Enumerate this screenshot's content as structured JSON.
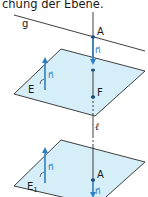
{
  "caption": "chung der Ebene.",
  "colors": {
    "plane_fill": "#d6eef8",
    "plane_stroke": "#2a2a2a",
    "vector_blue": "#2f7fc4",
    "line": "#2a2a2a",
    "point_fill": "#1d4f7a"
  },
  "labels": {
    "line_g": "g",
    "point_A_top": "A",
    "normal_top": "n⃗",
    "plane_E": "E",
    "normal_E": "n⃗",
    "point_F": "F",
    "line_l": "ℓ",
    "plane_E1_main": "E",
    "plane_E1_sub": "1",
    "normal_E1": "n⃗",
    "point_A_bottom": "A",
    "normal_bottom": "n⃗"
  }
}
